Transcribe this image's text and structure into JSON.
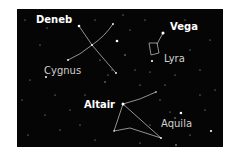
{
  "figure": {
    "background": "#050505",
    "line_color": "#cfcfcf",
    "star_color": "#ffffff"
  },
  "labels": {
    "deneb": "Deneb",
    "vega": "Vega",
    "altair": "Altair",
    "cygnus": "Cygnus",
    "lyra": "Lyra",
    "aquila": "Aquila"
  },
  "constellations": [
    {
      "name": "Cygnus",
      "bright_star": "Deneb"
    },
    {
      "name": "Lyra",
      "bright_star": "Vega"
    },
    {
      "name": "Aquila",
      "bright_star": "Altair"
    }
  ]
}
